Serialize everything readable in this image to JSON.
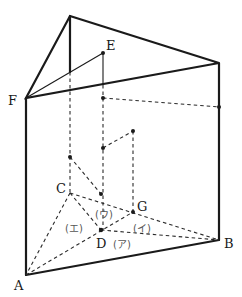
{
  "diagram": {
    "type": "triangular-prism",
    "labels": {
      "A": "A",
      "B": "B",
      "C": "C",
      "D": "D",
      "E": "E",
      "F": "F",
      "G": "G"
    },
    "regions": {
      "a": "(ア)",
      "i": "(イ)",
      "u": "(ウ)",
      "e": "(エ)"
    }
  }
}
